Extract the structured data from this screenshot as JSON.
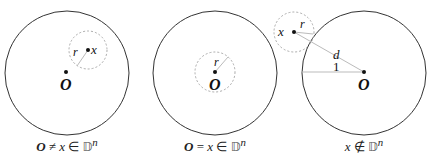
{
  "panels": [
    {
      "id": "panel-1",
      "caption": {
        "o": "O",
        "rel": " ≠ ",
        "x": "x",
        "in": " ∈ ",
        "D": "𝔻",
        "n": "n"
      },
      "labels": {
        "O": "O",
        "x": "x",
        "r": "r"
      },
      "unit_circle": {
        "cx": 67,
        "cy": 73,
        "r": 62
      },
      "origin": {
        "x": 66,
        "y": 72
      },
      "point_x": {
        "x": 88,
        "y": 50
      },
      "ball_radius": 19
    },
    {
      "id": "panel-2",
      "caption": {
        "o": "O",
        "rel": " = ",
        "x": "x",
        "in": " ∈ ",
        "D": "𝔻",
        "n": "n"
      },
      "labels": {
        "O": "O",
        "r": "r"
      },
      "unit_circle": {
        "cx": 215,
        "cy": 73,
        "r": 62
      },
      "origin": {
        "x": 215,
        "y": 72
      },
      "ball_radius": 20
    },
    {
      "id": "panel-3",
      "caption": {
        "x": "x",
        "notin": " ∉ ",
        "D": "𝔻",
        "n": "n"
      },
      "labels": {
        "O": "O",
        "x": "x",
        "r": "r",
        "d": "d",
        "one": "1"
      },
      "unit_circle": {
        "cx": 364,
        "cy": 73,
        "r": 62
      },
      "origin": {
        "x": 364,
        "y": 72
      },
      "point_x": {
        "x": 294,
        "y": 32
      },
      "ball_radius": 20
    }
  ],
  "colors": {
    "circle": "#333333",
    "dashed": "#aaaaaa",
    "radius_line": "#bbbbbb",
    "text": "#111111"
  }
}
